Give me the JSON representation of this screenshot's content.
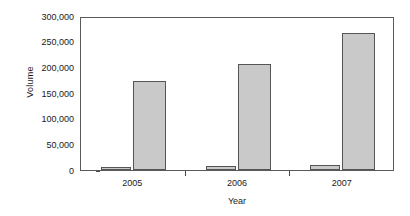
{
  "chart_data": {
    "type": "bar",
    "title": "",
    "subtitle": "",
    "xlabel": "Year",
    "ylabel": "Volume",
    "categories": [
      "2005",
      "2006",
      "2007"
    ],
    "series": [
      {
        "name": "series-1",
        "values": [
          6000,
          8000,
          9000
        ]
      },
      {
        "name": "series-2",
        "values": [
          174000,
          206000,
          266000
        ]
      }
    ],
    "ylim": [
      0,
      300000
    ],
    "ytick_labels": [
      "0",
      "50,000",
      "100,000",
      "150,000",
      "200,000",
      "250,000",
      "300,000"
    ],
    "ytick_values": [
      0,
      50000,
      100000,
      150000,
      200000,
      250000,
      300000
    ],
    "grid": false,
    "legend": "none",
    "bar_fill_color": "#c9c9c9",
    "bar_edge_color": "#555555",
    "axis_color": "#5a5a5a"
  }
}
